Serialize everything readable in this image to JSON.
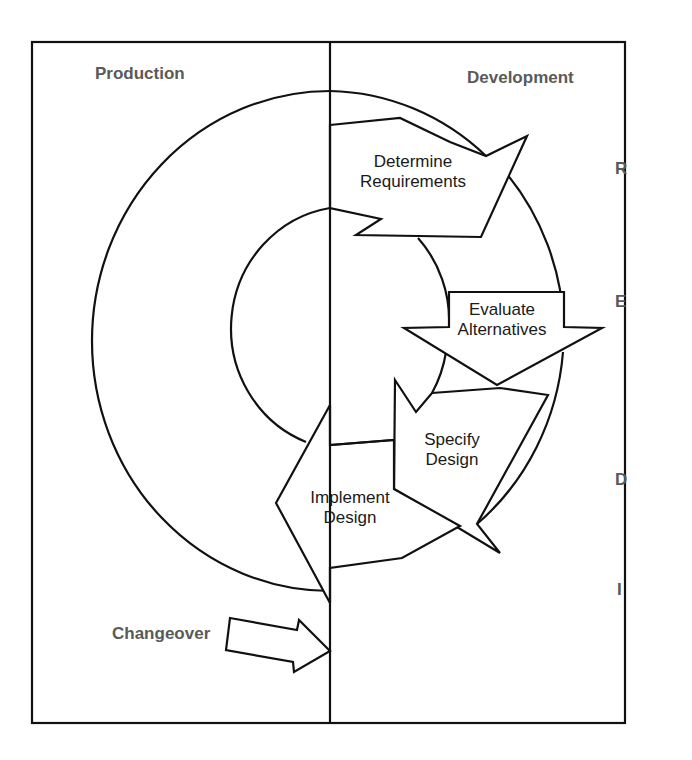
{
  "panels": {
    "left_heading": "Production",
    "right_heading": "Development"
  },
  "steps": [
    {
      "id": "R",
      "line1": "Determine",
      "line2": "Requirements"
    },
    {
      "id": "E",
      "line1": "Evaluate",
      "line2": "Alternatives"
    },
    {
      "id": "D",
      "line1": "Specify",
      "line2": "Design"
    },
    {
      "id": "I",
      "line1": "Implement",
      "line2": "Design"
    }
  ],
  "phase_letters": [
    "R",
    "E",
    "D",
    "I"
  ],
  "changeover_label": "Changeover",
  "colors": {
    "line": "#111111",
    "heading_text": "#5a5a5a",
    "body_text": "#1a1a1a",
    "background": "#ffffff"
  }
}
